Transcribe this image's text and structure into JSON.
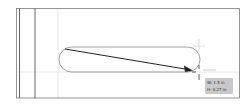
{
  "app": "vector drawing canvas",
  "tool": {
    "active": "arrow-line-tool",
    "cursor": "crosshair-icon"
  },
  "tooltip": {
    "width_label": "W: 1.5 in",
    "height_label": "H: 0.27 in"
  },
  "colors": {
    "frame": "#555555",
    "guide": "#d9d9d9",
    "shape_stroke": "#8a8a8a",
    "arrow": "#222222",
    "tooltip_bg": "#c9c9c9"
  }
}
